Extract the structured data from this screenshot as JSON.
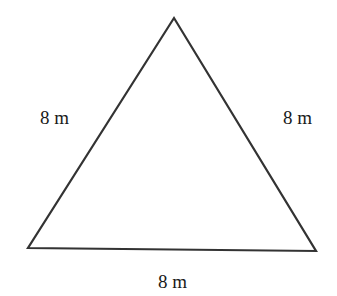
{
  "diagram": {
    "shape": "equilateral-triangle",
    "stroke_color": "#333333",
    "background_color": "#ffffff",
    "vertices": {
      "top": [
        174,
        18
      ],
      "bottom_left": [
        28,
        248
      ],
      "bottom_right": [
        316,
        251
      ]
    },
    "labels": {
      "left_side": "8 m",
      "right_side": "8 m",
      "bottom_side": "8 m"
    }
  }
}
